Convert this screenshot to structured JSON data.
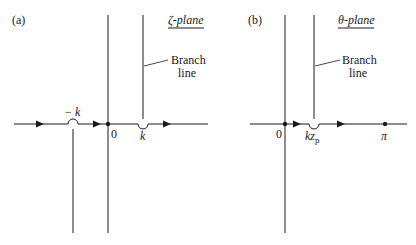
{
  "panels": [
    {
      "id": "a",
      "label": "(a)",
      "plane_title": "ζ-plane",
      "branch_label_line1": "Branch",
      "branch_label_line2": "line",
      "points": {
        "neg_k": "− k",
        "origin": "0",
        "k": "k"
      }
    },
    {
      "id": "b",
      "label": "(b)",
      "plane_title": "θ-plane",
      "branch_label_line1": "Branch",
      "branch_label_line2": "line",
      "points": {
        "origin": "0",
        "kzp_main": "kz",
        "kzp_sub": "p",
        "pi": "π"
      }
    }
  ],
  "colors": {
    "line": "#1a1a1a",
    "background": "#ffffff"
  }
}
